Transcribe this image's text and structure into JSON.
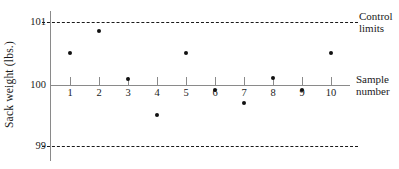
{
  "chart_data": {
    "type": "scatter",
    "title": "",
    "xlabel": "Sample number",
    "ylabel": "Sack weight (lbs.)",
    "categories": [
      "1",
      "2",
      "3",
      "4",
      "5",
      "6",
      "7",
      "8",
      "9",
      "10"
    ],
    "x": [
      1,
      2,
      3,
      4,
      5,
      6,
      7,
      8,
      9,
      10
    ],
    "values": [
      100.51,
      100.86,
      100.1,
      99.52,
      100.51,
      99.92,
      99.71,
      100.11,
      99.92,
      100.51
    ],
    "series": [
      {
        "name": "Sack weight",
        "values": [
          100.51,
          100.86,
          100.1,
          99.52,
          100.51,
          99.92,
          99.71,
          100.11,
          99.92,
          100.51
        ]
      }
    ],
    "ylim": [
      98.8,
      101.2
    ],
    "xlim": [
      0.3,
      10.7
    ],
    "grid": false,
    "legend": "none",
    "y_ticks": [
      {
        "value": 101,
        "label": "101"
      },
      {
        "value": 100,
        "label": "100"
      },
      {
        "value": 99,
        "label": "99"
      }
    ],
    "reference_lines": [
      {
        "name": "upper-control-limit",
        "value": 101,
        "style": "dashed",
        "color": "#1a1a1a"
      },
      {
        "name": "center-line",
        "value": 100,
        "style": "solid",
        "color": "#8a8a8a"
      },
      {
        "name": "lower-control-limit",
        "value": 99,
        "style": "dashed",
        "color": "#1a1a1a"
      }
    ],
    "annotations": [
      {
        "name": "control-limits",
        "line1": "Control",
        "line2": "limits"
      },
      {
        "name": "sample-number",
        "line1": "Sample",
        "line2": "number"
      }
    ],
    "point_color": "#111111",
    "axis_color": "#8a8a8a"
  }
}
